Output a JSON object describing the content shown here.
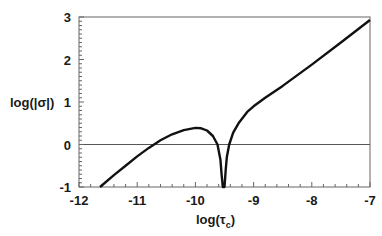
{
  "chart_data": {
    "type": "line",
    "title": "",
    "xlabel": "log(τc)",
    "xlabel_main": "log(τ",
    "xlabel_sub": "c",
    "xlabel_close": ")",
    "ylabel": "log(|σ|)",
    "xlim": [
      -12,
      -7
    ],
    "ylim": [
      -1,
      3
    ],
    "xticks": [
      -12,
      -11,
      -10,
      -9,
      -8,
      -7
    ],
    "yticks": [
      -1,
      0,
      1,
      2,
      3
    ],
    "grid": false,
    "frame": "box",
    "reference_line": {
      "y": 0,
      "color": "#555555"
    },
    "series": [
      {
        "name": "log|σ|",
        "color": "#111111",
        "x": [
          -11.64,
          -11.4,
          -11.2,
          -11.0,
          -10.8,
          -10.6,
          -10.4,
          -10.2,
          -10.0,
          -9.9,
          -9.8,
          -9.7,
          -9.62,
          -9.57,
          -9.55,
          -9.53,
          -9.52,
          -9.5,
          -9.48,
          -9.46,
          -9.42,
          -9.35,
          -9.25,
          -9.1,
          -9.0,
          -8.8,
          -8.5,
          -8.0,
          -7.5,
          -7.0
        ],
        "values": [
          -1.0,
          -0.72,
          -0.5,
          -0.28,
          -0.08,
          0.1,
          0.24,
          0.34,
          0.39,
          0.38,
          0.33,
          0.2,
          0.0,
          -0.35,
          -0.7,
          -1.0,
          -1.0,
          -1.0,
          -0.6,
          -0.3,
          0.0,
          0.28,
          0.52,
          0.78,
          0.9,
          1.1,
          1.38,
          1.88,
          2.4,
          2.93
        ]
      }
    ]
  }
}
